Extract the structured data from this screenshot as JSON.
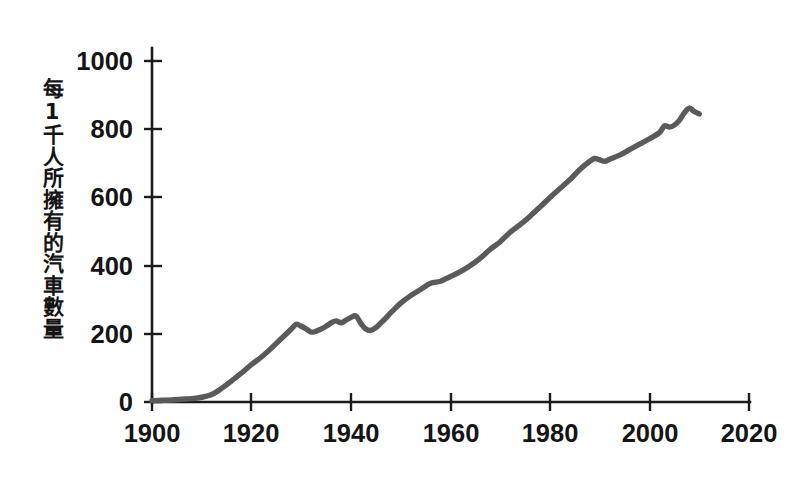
{
  "chart_data": {
    "type": "line",
    "title": "",
    "subtitle": "",
    "xlabel": "",
    "ylabel": "每1千人所擁有的汽車數量",
    "xlim": [
      1900,
      2020
    ],
    "ylim": [
      0,
      1000
    ],
    "grid": false,
    "legend": "none",
    "x_ticks": [
      "1900",
      "1920",
      "1940",
      "1960",
      "1980",
      "2000",
      "2020"
    ],
    "x_tick_values": [
      1900,
      1920,
      1940,
      1960,
      1980,
      2000,
      2020
    ],
    "y_ticks": [
      "0",
      "200",
      "400",
      "600",
      "800",
      "1000"
    ],
    "y_tick_values": [
      0,
      200,
      400,
      600,
      800,
      1000
    ],
    "series": [
      {
        "name": "每1千人所擁有的汽車數量",
        "color": "#5a5a5a",
        "x": [
          1900,
          1902,
          1904,
          1906,
          1908,
          1910,
          1912,
          1914,
          1916,
          1918,
          1920,
          1922,
          1924,
          1926,
          1928,
          1929,
          1930,
          1931,
          1932,
          1933,
          1934,
          1935,
          1936,
          1937,
          1938,
          1939,
          1940,
          1941,
          1942,
          1943,
          1944,
          1945,
          1946,
          1947,
          1948,
          1949,
          1950,
          1952,
          1954,
          1956,
          1958,
          1960,
          1962,
          1964,
          1966,
          1968,
          1970,
          1972,
          1974,
          1976,
          1978,
          1980,
          1982,
          1984,
          1986,
          1988,
          1989,
          1990,
          1991,
          1992,
          1994,
          1996,
          1998,
          2000,
          2002,
          2003,
          2004,
          2005,
          2006,
          2007,
          2008,
          2009,
          2010
        ],
        "y": [
          4,
          5,
          6,
          8,
          10,
          14,
          22,
          40,
          62,
          85,
          110,
          132,
          158,
          186,
          214,
          228,
          222,
          214,
          205,
          208,
          214,
          222,
          232,
          238,
          232,
          240,
          248,
          252,
          230,
          214,
          210,
          218,
          232,
          246,
          262,
          276,
          290,
          312,
          330,
          348,
          354,
          368,
          382,
          400,
          422,
          448,
          470,
          498,
          520,
          545,
          572,
          600,
          626,
          652,
          682,
          706,
          714,
          710,
          706,
          712,
          724,
          740,
          756,
          772,
          790,
          810,
          806,
          812,
          826,
          848,
          862,
          852,
          845
        ],
        "units": "cars per 1000 people"
      }
    ],
    "annotations": []
  },
  "axes": {
    "y_axis_title": "每1千人所擁有的汽車數量"
  }
}
